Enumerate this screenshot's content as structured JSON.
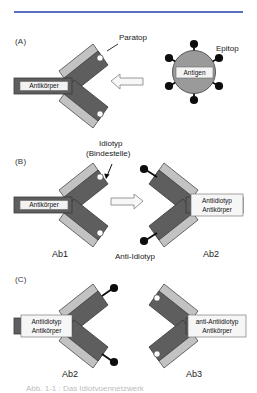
{
  "figure": {
    "title_rule_color": "#5b6fbe",
    "background": "#ffffff",
    "panels": [
      {
        "letter": "(A)",
        "antibody_label": "Antikörper",
        "callout_paratop": "Paratop",
        "antigen_label": "Antigen",
        "callout_epitop": "Epitop",
        "arrow": "left-arrow"
      },
      {
        "letter": "(B)",
        "callout_idiotyp_line1": "Idiotyp",
        "callout_idiotyp_line2": "(Bindestelle)",
        "left_antibody_label": "Antikörper",
        "left_caption": "Ab1",
        "right_antibody_label_line1": "Antiidiotyp",
        "right_antibody_label_line2": "Antikörper",
        "right_caption": "Ab2",
        "center_caption": "Anti-Idiotyp",
        "arrow": "right-arrow"
      },
      {
        "letter": "(C)",
        "left_antibody_label_line1": "Antiidiotyp",
        "left_antibody_label_line2": "Antikörper",
        "left_caption": "Ab2",
        "right_antibody_label_line1": "anti-Antiidiotyp",
        "right_antibody_label_line2": "Antikörper",
        "right_caption": "Ab3"
      }
    ],
    "colors": {
      "heavy_chain": "#5e5e5e",
      "light_chain": "#c2c2c2",
      "antigen_fill": "#9a9a9a",
      "epitope_knob": "#0d0d0d",
      "paratope_hole": "#ffffff",
      "outline": "#3a3a3a"
    },
    "caption_cut_off": "Abb. 1-1 : Das Idiotypennetzwerk"
  }
}
